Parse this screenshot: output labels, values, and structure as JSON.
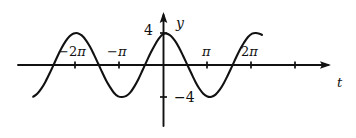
{
  "figure": {
    "kind": "math-graph",
    "background": "#ffffff",
    "ink_color": "#111111"
  },
  "axes": {
    "horizontal": {
      "name": "t",
      "label": "t",
      "arrow": "right",
      "origin_px": 163,
      "baseline_px": 65,
      "start_px": 18,
      "end_px": 331,
      "pixels_per_pi": 44
    },
    "vertical": {
      "name": "y",
      "label": "y",
      "arrow": "up",
      "top_px": 12,
      "bottom_px": 126
    }
  },
  "labels": {
    "y_axis": "y",
    "t_axis": "t",
    "y_max": "4",
    "y_min": "−4",
    "x_ticks": [
      {
        "text_sign": "−",
        "text_coeff": "2",
        "text_pi": "π",
        "value": -6.2832,
        "px": 75
      },
      {
        "text_sign": "−",
        "text_coeff": "",
        "text_pi": "π",
        "value": -3.1416,
        "px": 119
      },
      {
        "text_sign": "",
        "text_coeff": "",
        "text_pi": "π",
        "value": 3.1416,
        "px": 207
      },
      {
        "text_sign": "",
        "text_coeff": "2",
        "text_pi": "π",
        "value": 6.2832,
        "px": 251
      }
    ],
    "unlabeled_ticks_px": [
      295
    ],
    "y_ticks": [
      {
        "text": "4",
        "value": 4,
        "px": 33
      },
      {
        "text": "−4",
        "value": -4,
        "px": 97
      }
    ]
  },
  "chart_data": {
    "type": "line",
    "title": "",
    "xlabel": "t",
    "ylabel": "y",
    "function": "y = 4 cos(t)",
    "amplitude": 4,
    "period": "2π",
    "xlim": [
      -9.27,
      7.07
    ],
    "ylim": [
      -4,
      4
    ],
    "grid": false,
    "legend": null,
    "xtick_labels": [
      "−2π",
      "−π",
      "π",
      "2π"
    ],
    "xtick_values": [
      -6.2832,
      -3.1416,
      3.1416,
      6.2832
    ],
    "ytick_labels": [
      "4",
      "−4"
    ],
    "ytick_values": [
      4,
      -4
    ],
    "series": [
      {
        "name": "4cos(t)",
        "color": "#111111",
        "x": [
          -9.27,
          -8.98,
          -8.69,
          -8.4,
          -8.11,
          -7.82,
          -7.54,
          -7.25,
          -6.96,
          -6.67,
          -6.38,
          -6.09,
          -5.8,
          -5.51,
          -5.22,
          -4.93,
          -4.64,
          -4.35,
          -4.06,
          -3.77,
          -3.49,
          -3.2,
          -2.91,
          -2.62,
          -2.33,
          -2.04,
          -1.75,
          -1.46,
          -1.17,
          -0.88,
          -0.59,
          -0.3,
          -0.01,
          0.28,
          0.57,
          0.86,
          1.15,
          1.44,
          1.73,
          2.02,
          2.31,
          2.59,
          2.88,
          3.17,
          3.46,
          3.75,
          4.04,
          4.33,
          4.62,
          4.91,
          5.2,
          5.49,
          5.78,
          6.07,
          6.36,
          6.64,
          6.93,
          7.07
        ],
        "y": [
          -3.97,
          -3.6,
          -2.96,
          -2.11,
          -1.1,
          -0.01,
          1.07,
          2.09,
          2.95,
          3.6,
          3.94,
          3.98,
          3.7,
          3.11,
          2.3,
          1.3,
          0.22,
          -0.88,
          -1.93,
          -2.79,
          -3.5,
          -3.92,
          -4.0,
          -3.86,
          -3.42,
          -2.67,
          -1.74,
          -0.65,
          0.45,
          1.53,
          2.48,
          3.29,
          3.85,
          3.92,
          3.62,
          3.01,
          2.17,
          1.13,
          0.04,
          -1.04,
          -2.08,
          -2.94,
          -3.59,
          -3.94,
          -3.98,
          -3.7,
          -3.12,
          -2.31,
          -1.31,
          -0.23,
          0.87,
          1.92,
          2.78,
          3.5,
          3.92,
          4.0,
          3.87,
          3.76
        ]
      }
    ]
  }
}
